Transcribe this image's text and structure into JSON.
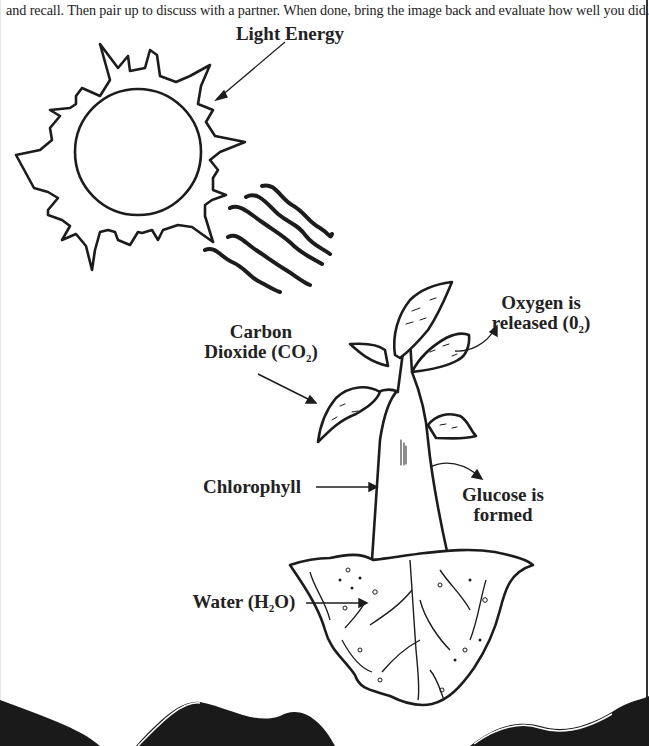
{
  "instructions": {
    "text": "and recall.  Then pair up to discuss with a partner. When done, bring the image back and evaluate how well you did."
  },
  "diagram": {
    "labels": {
      "light_energy": "Light Energy",
      "carbon_dioxide_line1": "Carbon",
      "carbon_dioxide_line2": "Dioxide (CO",
      "carbon_dioxide_sub": "2",
      "carbon_dioxide_close": ")",
      "oxygen_line1": "Oxygen is",
      "oxygen_line2": "released (0",
      "oxygen_sub": "2",
      "oxygen_close": ")",
      "chlorophyll": "Chlorophyll",
      "glucose_line1": "Glucose is",
      "glucose_line2": "formed",
      "water_prefix": "Water (H",
      "water_sub": "2",
      "water_suffix": "O)"
    },
    "elements": [
      "sun-icon",
      "light-rays-icon",
      "plant-icon",
      "soil-icon",
      "roots-icon"
    ]
  },
  "colors": {
    "ink": "#1c1c1c",
    "background": "#ffffff",
    "footer_band": "#1a1a1a"
  }
}
